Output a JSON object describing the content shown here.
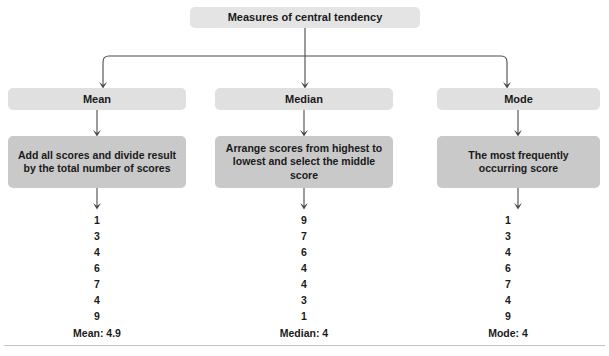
{
  "diagram": {
    "root": {
      "label": "Measures of central tendency"
    },
    "columns": [
      {
        "key": "mean",
        "label": "Mean",
        "description": "Add all scores and divide result by the total number of scores",
        "scores": [
          "1",
          "3",
          "4",
          "6",
          "7",
          "4",
          "9"
        ],
        "summary": "Mean: 4.9"
      },
      {
        "key": "median",
        "label": "Median",
        "description": "Arrange scores from highest to lowest and select the middle score",
        "scores": [
          "9",
          "7",
          "6",
          "4",
          "4",
          "3",
          "1"
        ],
        "summary": "Median: 4"
      },
      {
        "key": "mode",
        "label": "Mode",
        "description": "The most frequently occurring score",
        "scores": [
          "1",
          "3",
          "4",
          "6",
          "7",
          "4",
          "9"
        ],
        "summary": "Mode: 4"
      }
    ]
  },
  "style": {
    "root_box_color": "#e4e4e4",
    "label_box_color": "#e0e0e0",
    "description_box_color": "#c9c9c9",
    "connector_color": "#4a4a4a",
    "rule_color": "#c3c3c3",
    "text_color": "#1a1a1a"
  }
}
